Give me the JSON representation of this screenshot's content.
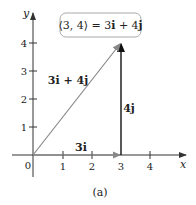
{
  "diagram": {
    "equation_box": "⟨3, 4⟩ = 3i + 4j",
    "equation_parts": {
      "lhs": "⟨3, 4⟩ = ",
      "i_coef": "3",
      "i": "i",
      "plus": " + ",
      "j_coef": "4",
      "j": "j"
    },
    "vector_label": "3i + 4j",
    "horizontal_label": "3i",
    "vertical_label": "4j",
    "axis_x_label": "x",
    "axis_y_label": "y",
    "origin_label": "0",
    "x_ticks": [
      "1",
      "2",
      "3",
      "4"
    ],
    "y_ticks": [
      "1",
      "2",
      "3",
      "4"
    ],
    "caption": "(a)",
    "colors": {
      "axis": "#333333",
      "diagonal_vector": "#888888",
      "horizontal_vector": "#888888",
      "vertical_vector": "#111111",
      "box_border": "#aaaaaa"
    }
  }
}
